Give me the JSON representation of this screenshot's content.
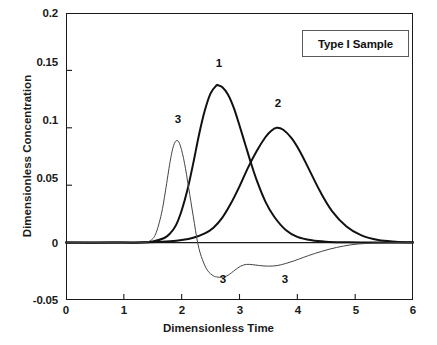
{
  "chart_data": {
    "type": "line",
    "title": "Type I Sample",
    "xlabel": "Dimensionless Time",
    "ylabel": "Dimensionless Concentration",
    "xlim": [
      0,
      6
    ],
    "ylim": [
      -0.05,
      0.2
    ],
    "xticks": [
      "0",
      "1",
      "2",
      "3",
      "4",
      "5",
      "6"
    ],
    "xtick_values": [
      0,
      1,
      2,
      3,
      4,
      5,
      6
    ],
    "yticks": [
      "0.2",
      "0.15",
      "0.1",
      "0.05",
      "0",
      "-0.05"
    ],
    "ytick_values": [
      0.2,
      0.15,
      0.1,
      0.05,
      0,
      -0.05
    ],
    "grid": false,
    "legend": "none",
    "annotations": [
      {
        "text": "1",
        "x": 2.63,
        "y": 0.152
      },
      {
        "text": "2",
        "x": 3.64,
        "y": 0.117
      },
      {
        "text": "3",
        "x": 1.92,
        "y": 0.106
      },
      {
        "text": "3",
        "x": 2.7,
        "y": -0.037
      },
      {
        "text": "3",
        "x": 3.77,
        "y": -0.037
      }
    ],
    "series": [
      {
        "name": "1",
        "style": "thick",
        "color": "#111111",
        "peak_x": 2.63,
        "peak_y": 0.137,
        "x": [
          0.0,
          0.5,
          1.0,
          1.3,
          1.5,
          1.7,
          1.8,
          1.9,
          2.0,
          2.1,
          2.2,
          2.3,
          2.4,
          2.5,
          2.6,
          2.63,
          2.7,
          2.8,
          2.9,
          3.0,
          3.1,
          3.2,
          3.3,
          3.45,
          3.6,
          3.8,
          4.0,
          4.25,
          4.5,
          4.8,
          5.1,
          5.5,
          6.0
        ],
        "y": [
          0.0,
          0.0,
          0.0,
          0.0,
          0.001,
          0.004,
          0.008,
          0.015,
          0.028,
          0.046,
          0.069,
          0.094,
          0.115,
          0.13,
          0.1368,
          0.137,
          0.1355,
          0.129,
          0.1175,
          0.102,
          0.0855,
          0.069,
          0.054,
          0.0355,
          0.0225,
          0.011,
          0.005,
          0.002,
          0.0008,
          0.0003,
          0.0001,
          0.0,
          0.0
        ]
      },
      {
        "name": "2",
        "style": "thick",
        "color": "#111111",
        "peak_x": 3.64,
        "peak_y": 0.1,
        "x": [
          0.0,
          0.8,
          1.4,
          1.8,
          2.0,
          2.2,
          2.4,
          2.55,
          2.7,
          2.85,
          3.0,
          3.15,
          3.3,
          3.45,
          3.55,
          3.64,
          3.75,
          3.9,
          4.05,
          4.2,
          4.4,
          4.6,
          4.85,
          5.1,
          5.4,
          5.7,
          6.0
        ],
        "y": [
          0.0,
          0.0,
          0.0003,
          0.0012,
          0.0022,
          0.0042,
          0.008,
          0.013,
          0.0215,
          0.034,
          0.049,
          0.0655,
          0.08,
          0.092,
          0.0975,
          0.1,
          0.0985,
          0.091,
          0.079,
          0.064,
          0.044,
          0.0275,
          0.014,
          0.0065,
          0.0022,
          0.0008,
          0.0002
        ]
      },
      {
        "name": "3",
        "style": "thin",
        "color": "#444444",
        "peak_x": 1.92,
        "peak_y": 0.089,
        "min_x": 2.7,
        "min_y": -0.03,
        "x": [
          0.0,
          0.8,
          1.3,
          1.45,
          1.55,
          1.65,
          1.72,
          1.8,
          1.86,
          1.92,
          1.98,
          2.05,
          2.12,
          2.2,
          2.28,
          2.36,
          2.45,
          2.55,
          2.62,
          2.7,
          2.8,
          2.92,
          3.02,
          3.12,
          3.22,
          3.35,
          3.5,
          3.65,
          3.8,
          3.95,
          4.1,
          4.3,
          4.55,
          4.8,
          5.05,
          5.35,
          5.7,
          6.0
        ],
        "y": [
          0.0,
          0.0,
          0.0,
          0.0015,
          0.0075,
          0.025,
          0.045,
          0.0705,
          0.0845,
          0.089,
          0.084,
          0.069,
          0.048,
          0.023,
          -0.001,
          -0.015,
          -0.0245,
          -0.029,
          -0.03,
          -0.0302,
          -0.0285,
          -0.024,
          -0.0205,
          -0.019,
          -0.0192,
          -0.02,
          -0.0205,
          -0.02,
          -0.0182,
          -0.0158,
          -0.013,
          -0.0095,
          -0.0058,
          -0.003,
          -0.0012,
          -0.0004,
          -0.0001,
          0.0
        ]
      }
    ]
  }
}
